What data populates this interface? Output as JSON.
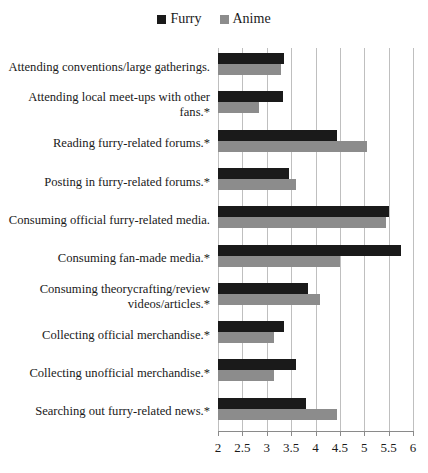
{
  "chart_data": {
    "type": "bar",
    "orientation": "horizontal",
    "title": "",
    "xlabel": "",
    "ylabel": "",
    "xlim": [
      2,
      6
    ],
    "xticks": [
      "2",
      "2.5",
      "3",
      "3.5",
      "4",
      "4.5",
      "5",
      "5.5",
      "6"
    ],
    "xtick_values": [
      2,
      2.5,
      3,
      3.5,
      4,
      4.5,
      5,
      5.5,
      6
    ],
    "grid": true,
    "legend_position": "top-center",
    "categories": [
      "Attending conventions/large gatherings.",
      "Attending local meet-ups with other fans.*",
      "Reading furry-related forums.*",
      "Posting in furry-related forums.*",
      "Consuming official furry-related media.",
      "Consuming fan-made media.*",
      "Consuming theorycrafting/review videos/articles.*",
      "Collecting official merchandise.*",
      "Collecting unofficial merchandise.*",
      "Searching out furry-related news.*"
    ],
    "series": [
      {
        "name": "Furry",
        "color": "#1a1a1a",
        "values": [
          3.35,
          3.33,
          4.45,
          3.45,
          5.5,
          5.75,
          3.85,
          3.35,
          3.6,
          3.8
        ]
      },
      {
        "name": "Anime",
        "color": "#8c8c8c",
        "values": [
          3.3,
          2.85,
          5.05,
          3.6,
          5.45,
          4.5,
          4.1,
          3.15,
          3.15,
          4.45
        ]
      }
    ]
  },
  "legend": {
    "entries": [
      {
        "label": "Furry",
        "color": "#1a1a1a",
        "swatch_name": "legend-swatch-furry"
      },
      {
        "label": "Anime",
        "color": "#8c8c8c",
        "swatch_name": "legend-swatch-anime"
      }
    ]
  },
  "colors": {
    "furry": "#1a1a1a",
    "anime": "#8c8c8c",
    "gridline": "#bfbfbf",
    "axis": "#8a8a8a",
    "background": "#ffffff",
    "text": "#1a1a1a"
  }
}
